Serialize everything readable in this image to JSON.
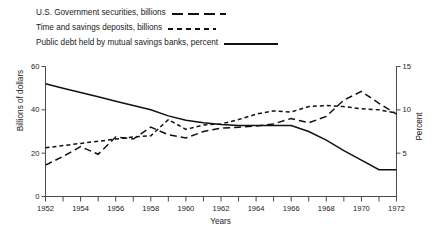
{
  "chart_data": {
    "type": "line",
    "title": "",
    "xlabel": "Years",
    "ylabel": "Billions of dollars",
    "ylabel_right": "Percent",
    "xlim": [
      1952,
      1972
    ],
    "ylim": [
      0,
      60
    ],
    "ylim_right": [
      0,
      15
    ],
    "grid": false,
    "legend_position": "above-plot",
    "yticks": [
      "0",
      "20",
      "40",
      "60"
    ],
    "ytick_values": [
      0,
      20,
      40,
      60
    ],
    "yticks_right": [
      "5",
      "10",
      "15"
    ],
    "ytick_values_right": [
      5,
      10,
      15
    ],
    "xticks": [
      "1952",
      "1954",
      "1956",
      "1958",
      "1960",
      "1962",
      "1964",
      "1966",
      "1968",
      "1970",
      "1972"
    ],
    "xtick_values": [
      1952,
      1954,
      1956,
      1958,
      1960,
      1962,
      1964,
      1966,
      1968,
      1970,
      1972
    ],
    "x": [
      1952,
      1953,
      1954,
      1955,
      1956,
      1957,
      1958,
      1959,
      1960,
      1961,
      1962,
      1963,
      1964,
      1965,
      1966,
      1967,
      1968,
      1969,
      1970,
      1971,
      1972
    ],
    "series": [
      {
        "name": "U.S. Government securities, billions",
        "style": "long-dash",
        "axis": "left",
        "units": "billions",
        "values": [
          14.5,
          18.5,
          23.0,
          19.5,
          27.5,
          26.5,
          32.0,
          28.5,
          27.0,
          30.0,
          31.5,
          32.0,
          32.5,
          33.5,
          36.0,
          34.0,
          37.0,
          44.5,
          48.5,
          43.0,
          38.0
        ]
      },
      {
        "name": "Time and savings deposits, billions",
        "style": "short-dash",
        "axis": "left",
        "units": "billions",
        "values": [
          22.5,
          23.5,
          24.5,
          25.5,
          26.5,
          27.5,
          28.0,
          35.5,
          31.0,
          33.0,
          33.5,
          35.5,
          38.0,
          39.5,
          39.0,
          41.5,
          42.0,
          41.5,
          40.5,
          40.0,
          38.5
        ]
      },
      {
        "name": "Public debt held by mutual savings banks, percent",
        "style": "solid",
        "axis": "right",
        "units": "percent",
        "values": [
          13.0,
          12.5,
          12.0,
          11.5,
          11.0,
          10.5,
          10.0,
          9.3,
          8.8,
          8.5,
          8.3,
          8.2,
          8.2,
          8.2,
          8.2,
          7.5,
          6.5,
          5.3,
          4.2,
          3.1,
          3.1
        ]
      }
    ]
  },
  "legend": {
    "items": [
      {
        "label": "U.S. Government securities, billions",
        "style": "long-dash"
      },
      {
        "label": "Time and savings deposits, billions",
        "style": "short-dash"
      },
      {
        "label": "Public debt held by mutual savings banks, percent",
        "style": "solid"
      }
    ]
  }
}
